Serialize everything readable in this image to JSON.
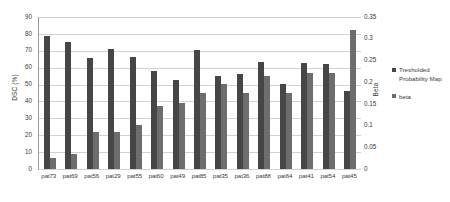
{
  "chart_data": {
    "type": "bar",
    "title": "",
    "xlabel": "",
    "ylabel": "DSC (%)",
    "y2label": "Beta",
    "grid": true,
    "legend_position": "right",
    "ylim": [
      0,
      90
    ],
    "y2lim": [
      0,
      0.35
    ],
    "yticks": [
      "0",
      "10",
      "20",
      "30",
      "40",
      "50",
      "60",
      "70",
      "80",
      "90"
    ],
    "y2ticks": [
      "0",
      "0.05",
      "0.1",
      "0.15",
      "0.2",
      "0.25",
      "0.3",
      "0.35"
    ],
    "categories": [
      "pat73",
      "pat69",
      "pat56",
      "pat29",
      "pat55",
      "pat60",
      "pat49",
      "pat85",
      "pat35",
      "pat36",
      "pat88",
      "pat64",
      "pat41",
      "pat54",
      "pat45"
    ],
    "series": [
      {
        "name": "Tresholded Probability Map",
        "axis": "left",
        "color": "#464646",
        "values": [
          78.5,
          75.5,
          65.5,
          71.0,
          66.5,
          58.0,
          52.5,
          70.5,
          55.0,
          56.5,
          63.5,
          50.5,
          62.5,
          62.0,
          46.0
        ]
      },
      {
        "name": "beta",
        "axis": "right",
        "color": "#6d6d6d",
        "values": [
          0.026,
          0.034,
          0.086,
          0.086,
          0.102,
          0.145,
          0.151,
          0.175,
          0.195,
          0.175,
          0.215,
          0.175,
          0.222,
          0.222,
          0.32
        ]
      }
    ]
  },
  "legend": {
    "items": [
      {
        "label": "Tresholded Probability Map",
        "color": "#464646"
      },
      {
        "label": "beta",
        "color": "#6d6d6d"
      }
    ]
  },
  "colors": {
    "series_dsc": "#464646",
    "series_beta": "#6d6d6d",
    "gridline": "#d2d2d2",
    "axis": "#9a9a9a",
    "text": "#3a3a3a",
    "background": "#ffffff"
  }
}
